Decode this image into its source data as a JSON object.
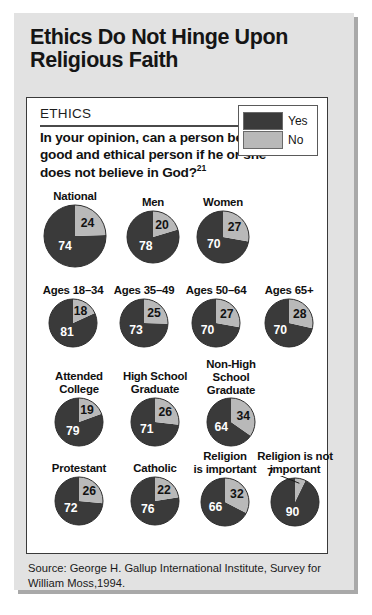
{
  "title": "Ethics Do Not Hinge Upon Religious Faith",
  "card": {
    "section_label": "ETHICS",
    "question": "In your opinion, can a person be a good and ethical person if he or she does not believe in God?",
    "question_footnote": "21"
  },
  "legend": {
    "items": [
      {
        "label": "Yes",
        "color": "#3a3a3a"
      },
      {
        "label": "No",
        "color": "#b9b9b9"
      }
    ]
  },
  "source": "Source: George H. Gallup International Institute, Survey for William Moss,1994.",
  "chart_data": {
    "type": "pie",
    "title": "Ethics Do Not Hinge Upon Religious Faith",
    "question": "In your opinion, can a person be a good and ethical person if he or she does not believe in God?",
    "legend": [
      "Yes",
      "No"
    ],
    "legend_position": "top-right",
    "colors": {
      "Yes": "#3a3a3a",
      "No": "#b9b9b9"
    },
    "units": "percent",
    "groups": [
      {
        "label": "National",
        "yes": 74,
        "no": 24
      },
      {
        "label": "Men",
        "yes": 78,
        "no": 20
      },
      {
        "label": "Women",
        "yes": 70,
        "no": 27
      },
      {
        "label": "Ages 18–34",
        "yes": 81,
        "no": 18
      },
      {
        "label": "Ages 35–49",
        "yes": 73,
        "no": 25
      },
      {
        "label": "Ages 50–64",
        "yes": 70,
        "no": 27
      },
      {
        "label": "Ages 65+",
        "yes": 70,
        "no": 28
      },
      {
        "label": "Attended\nCollege",
        "yes": 79,
        "no": 19
      },
      {
        "label": "High School\nGraduate",
        "yes": 71,
        "no": 26
      },
      {
        "label": "Non-High\nSchool\nGraduate",
        "yes": 64,
        "no": 34
      },
      {
        "label": "Protestant",
        "yes": 72,
        "no": 26
      },
      {
        "label": "Catholic",
        "yes": 76,
        "no": 22
      },
      {
        "label": "Religion\nis important",
        "yes": 66,
        "no": 32
      },
      {
        "label": "Religion is not\nimportant",
        "yes": 90,
        "no": 7
      }
    ]
  },
  "layout": {
    "cells": [
      {
        "left": 10,
        "top": 92,
        "labelTop": 0,
        "size": 62,
        "labelLines": 1,
        "noOutside": false
      },
      {
        "left": 88,
        "top": 98,
        "labelTop": 0,
        "size": 52,
        "labelLines": 1,
        "noOutside": false
      },
      {
        "left": 158,
        "top": 98,
        "labelTop": 0,
        "size": 52,
        "labelLines": 1,
        "noOutside": false
      },
      {
        "left": 8,
        "top": 186,
        "labelTop": 0,
        "size": 48,
        "labelLines": 1,
        "noOutside": false
      },
      {
        "left": 79,
        "top": 186,
        "labelTop": 0,
        "size": 48,
        "labelLines": 1,
        "noOutside": false
      },
      {
        "left": 151,
        "top": 186,
        "labelTop": 0,
        "size": 48,
        "labelLines": 1,
        "noOutside": false
      },
      {
        "left": 224,
        "top": 186,
        "labelTop": 0,
        "size": 48,
        "labelLines": 1,
        "noOutside": false
      },
      {
        "left": 14,
        "top": 272,
        "labelTop": 0,
        "size": 48,
        "labelLines": 2,
        "noOutside": false
      },
      {
        "left": 90,
        "top": 272,
        "labelTop": 0,
        "size": 48,
        "labelLines": 2,
        "noOutside": false
      },
      {
        "left": 166,
        "top": 260,
        "labelTop": 0,
        "size": 48,
        "labelLines": 3,
        "noOutside": false
      },
      {
        "left": 14,
        "top": 364,
        "labelTop": 0,
        "size": 48,
        "labelLines": 1,
        "noOutside": false
      },
      {
        "left": 90,
        "top": 364,
        "labelTop": 0,
        "size": 48,
        "labelLines": 1,
        "noOutside": false
      },
      {
        "left": 160,
        "top": 352,
        "labelTop": 0,
        "size": 48,
        "labelLines": 2,
        "noOutside": false
      },
      {
        "left": 230,
        "top": 352,
        "labelTop": 0,
        "size": 48,
        "labelLines": 2,
        "noOutside": true
      }
    ]
  }
}
